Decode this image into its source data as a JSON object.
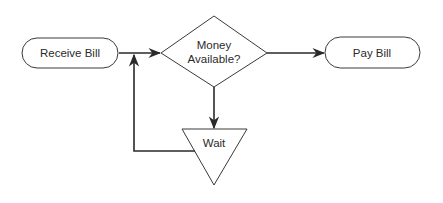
{
  "diagram": {
    "type": "flowchart",
    "nodes": [
      {
        "id": "receive",
        "shape": "terminator",
        "label": "Receive Bill"
      },
      {
        "id": "decision",
        "shape": "diamond",
        "label_line1": "Money",
        "label_line2": "Available?"
      },
      {
        "id": "pay",
        "shape": "terminator",
        "label": "Pay Bill"
      },
      {
        "id": "wait",
        "shape": "inverted-triangle",
        "label": "Wait"
      }
    ],
    "edges": [
      {
        "from": "receive",
        "to": "decision"
      },
      {
        "from": "decision",
        "to": "pay"
      },
      {
        "from": "decision",
        "to": "wait"
      },
      {
        "from": "wait",
        "to": "decision"
      }
    ],
    "colors": {
      "stroke": "#3a3a3a",
      "background": "#ffffff",
      "text": "#2a2a2a"
    }
  }
}
